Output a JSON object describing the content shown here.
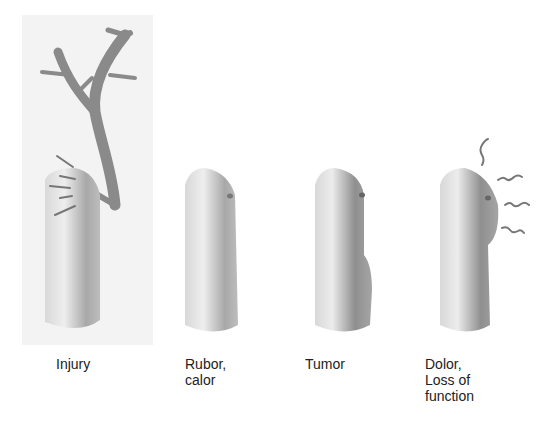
{
  "figure": {
    "stages": [
      {
        "id": "injury",
        "label_lines": [
          "Injury"
        ]
      },
      {
        "id": "rubor-calor",
        "label_lines": [
          "Rubor,",
          "calor"
        ]
      },
      {
        "id": "tumor",
        "label_lines": [
          "Tumor"
        ]
      },
      {
        "id": "dolor",
        "label_lines": [
          "Dolor,",
          "Loss of",
          "function"
        ]
      }
    ]
  },
  "colors": {
    "panel_bg": "#f3f3f3",
    "finger_light": "#e6e6e6",
    "finger_dark": "#9a9a9a",
    "text": "#222222"
  }
}
